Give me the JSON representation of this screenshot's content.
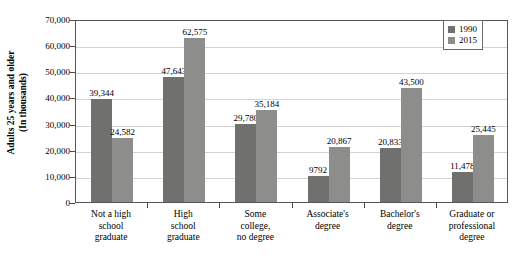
{
  "chart_data": {
    "type": "bar",
    "title": "",
    "xlabel": "",
    "ylabel": "Adults 25 years and older (In thousands)",
    "ylabel_line1": "Adults 25 years and older",
    "ylabel_line2": "(In thousands)",
    "ylim": [
      0,
      70000
    ],
    "grid": true,
    "legend_position": "top-right",
    "categories": [
      "Not a high school graduate",
      "High school graduate",
      "Some college, no degree",
      "Associate's degree",
      "Bachelor's degree",
      "Graduate or professional degree"
    ],
    "category_lines": [
      [
        "Not a high",
        "school",
        "graduate"
      ],
      [
        "High",
        "school",
        "graduate"
      ],
      [
        "Some",
        "college,",
        "no degree"
      ],
      [
        "Associate's",
        "degree"
      ],
      [
        "Bachelor's",
        "degree"
      ],
      [
        "Graduate or",
        "professional",
        "degree"
      ]
    ],
    "series": [
      {
        "name": "1990",
        "color": "#70706f",
        "values": [
          39344,
          47643,
          29780,
          9792,
          20833,
          11478
        ],
        "labels": [
          "39,344",
          "47,643",
          "29,780",
          "9792",
          "20,833",
          "11,478"
        ]
      },
      {
        "name": "2015",
        "color": "#8d8d8c",
        "values": [
          24582,
          62575,
          35184,
          20867,
          43500,
          25445
        ],
        "labels": [
          "24,582",
          "62,575",
          "35,184",
          "20,867",
          "43,500",
          "25,445"
        ]
      }
    ],
    "y_ticks": [
      0,
      10000,
      20000,
      30000,
      40000,
      50000,
      60000,
      70000
    ],
    "y_tick_labels": [
      "0",
      "10,000",
      "20,000",
      "30,000",
      "40,000",
      "50,000",
      "60,000",
      "70,000"
    ]
  },
  "legend": {
    "entries": [
      {
        "label": "1990",
        "color": "#70706f"
      },
      {
        "label": "2015",
        "color": "#8d8d8c"
      }
    ]
  },
  "colors": {
    "series_1990": "#70706f",
    "series_2015": "#8d8d8c",
    "gridline": "#d2d2d2",
    "frame": "#555555",
    "plot_background": "#ffffff"
  }
}
